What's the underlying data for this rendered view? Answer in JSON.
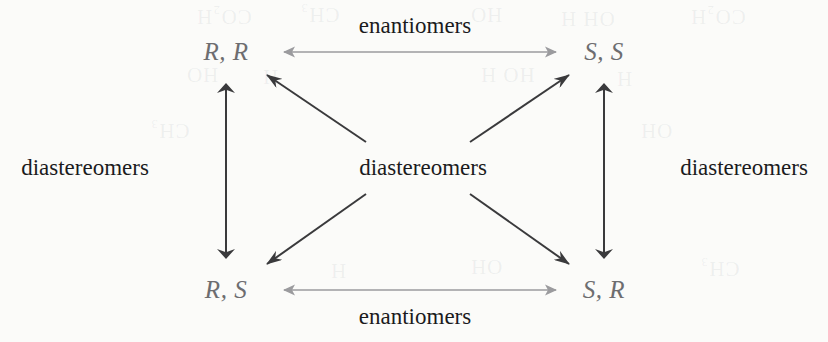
{
  "figure": {
    "type": "stereochemistry-relationship-diagram",
    "background_color": "#fbfbf9"
  },
  "nodes": [
    {
      "id": "rr",
      "label": "R, R",
      "position": "top-left",
      "x": 226,
      "y": 52,
      "color": "#6d6d70"
    },
    {
      "id": "ss",
      "label": "S, S",
      "position": "top-right",
      "x": 604,
      "y": 52,
      "color": "#6d6d70"
    },
    {
      "id": "rs",
      "label": "R, S",
      "position": "bottom-left",
      "x": 226,
      "y": 290,
      "color": "#6d6d70"
    },
    {
      "id": "sr",
      "label": "S, R",
      "position": "bottom-right",
      "x": 604,
      "y": 290,
      "color": "#6d6d70"
    }
  ],
  "relationships": [
    {
      "id": "enantiomers-top",
      "label": "enantiomers",
      "connects": [
        "R, R",
        "S, S"
      ],
      "orientation": "horizontal",
      "arrow": "double-headed",
      "arrow_color": "#9b9b9e",
      "label_x": 415,
      "label_y": 26
    },
    {
      "id": "enantiomers-bottom",
      "label": "enantiomers",
      "connects": [
        "R, S",
        "S, R"
      ],
      "orientation": "horizontal",
      "arrow": "double-headed",
      "arrow_color": "#9b9b9e",
      "label_x": 415,
      "label_y": 317
    },
    {
      "id": "diastereomers-left",
      "label": "diastereomers",
      "connects": [
        "R, R",
        "R, S"
      ],
      "orientation": "vertical",
      "arrow": "double-headed",
      "arrow_color": "#3a3a3c",
      "label_x": 85,
      "label_y": 168
    },
    {
      "id": "diastereomers-right",
      "label": "diastereomers",
      "connects": [
        "S, S",
        "S, R"
      ],
      "orientation": "vertical",
      "arrow": "double-headed",
      "arrow_color": "#3a3a3c",
      "label_x": 744,
      "label_y": 168
    },
    {
      "id": "diastereomers-center",
      "label": "diastereomers",
      "connects": [
        "R, R",
        "S, S",
        "R, S",
        "S, R"
      ],
      "orientation": "diagonal-radial",
      "arrow": "single-headed",
      "arrow_color": "#3a3a3c",
      "label_x": 423,
      "label_y": 168
    }
  ],
  "bleed_through": [
    {
      "text": "CO₂H",
      "x": 196,
      "y": 4,
      "rotation": 180
    },
    {
      "text": "CH₃",
      "x": 300,
      "y": 2,
      "rotation": 180
    },
    {
      "text": "HO",
      "x": 470,
      "y": 2,
      "rotation": 180
    },
    {
      "text": "OH H",
      "x": 560,
      "y": 6,
      "rotation": 180
    },
    {
      "text": "CO₂H",
      "x": 690,
      "y": 4,
      "rotation": 180
    },
    {
      "text": "HO",
      "x": 186,
      "y": 62,
      "rotation": 180
    },
    {
      "text": "H",
      "x": 262,
      "y": 64,
      "rotation": 180
    },
    {
      "text": "HO H",
      "x": 480,
      "y": 62,
      "rotation": 180
    },
    {
      "text": "H",
      "x": 616,
      "y": 66,
      "rotation": 180
    },
    {
      "text": "CH₃",
      "x": 150,
      "y": 118,
      "rotation": 180
    },
    {
      "text": "OH",
      "x": 640,
      "y": 118,
      "rotation": 180
    },
    {
      "text": "H",
      "x": 330,
      "y": 258,
      "rotation": 180
    },
    {
      "text": "OH",
      "x": 470,
      "y": 254,
      "rotation": 180
    },
    {
      "text": "CH₃",
      "x": 700,
      "y": 256,
      "rotation": 180
    }
  ]
}
